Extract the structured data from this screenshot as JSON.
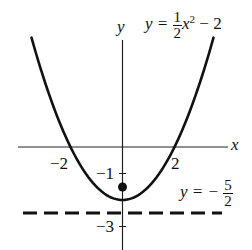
{
  "chart_data": {
    "type": "line",
    "title": "",
    "xlabel": "x",
    "ylabel": "y",
    "xlim": [
      -4.7,
      4.1
    ],
    "ylim": [
      -3.9,
      4.2
    ],
    "grid": false,
    "series": [
      {
        "name": "y = 1/2 x^2 - 2",
        "kind": "curve",
        "style": "solid",
        "function": "0.5*x^2 - 2",
        "x": [
          -3.5,
          -3,
          -2.5,
          -2,
          -1.5,
          -1,
          -0.5,
          0,
          0.5,
          1,
          1.5,
          2,
          2.5,
          3,
          3.5
        ],
        "y": [
          4.125,
          2.5,
          1.125,
          0,
          -0.875,
          -1.5,
          -1.875,
          -2,
          -1.875,
          -1.5,
          -0.875,
          0,
          1.125,
          2.5,
          4.125
        ]
      },
      {
        "name": "y = -5/2",
        "kind": "directrix",
        "style": "dashed",
        "x": [
          -3.8,
          3.7
        ],
        "y": [
          -2.5,
          -2.5
        ]
      },
      {
        "name": "focus",
        "kind": "point",
        "x": [
          0
        ],
        "y": [
          -1.5
        ]
      }
    ],
    "x_ticks": [
      {
        "value": -2,
        "label": "−2"
      },
      {
        "value": 2,
        "label": "2"
      }
    ],
    "y_ticks": [
      {
        "value": -1,
        "label": "−1"
      },
      {
        "value": -3,
        "label": "−3"
      }
    ],
    "annotations": [
      {
        "text": "y = 1/2 x² − 2",
        "target": "parabola"
      },
      {
        "text": "y = −5/2",
        "target": "directrix"
      }
    ]
  },
  "labels": {
    "y_axis": "y",
    "x_axis": "x",
    "eq_lhs": "y =",
    "eq_num": "1",
    "eq_den": "2",
    "eq_var": "x",
    "eq_exp": "2",
    "eq_rest": "− 2",
    "dir_lhs": "y = −",
    "dir_num": "5",
    "dir_den": "2",
    "tick_xm2": "−2",
    "tick_x2": "2",
    "tick_ym1": "−1",
    "tick_ym3": "−3"
  }
}
